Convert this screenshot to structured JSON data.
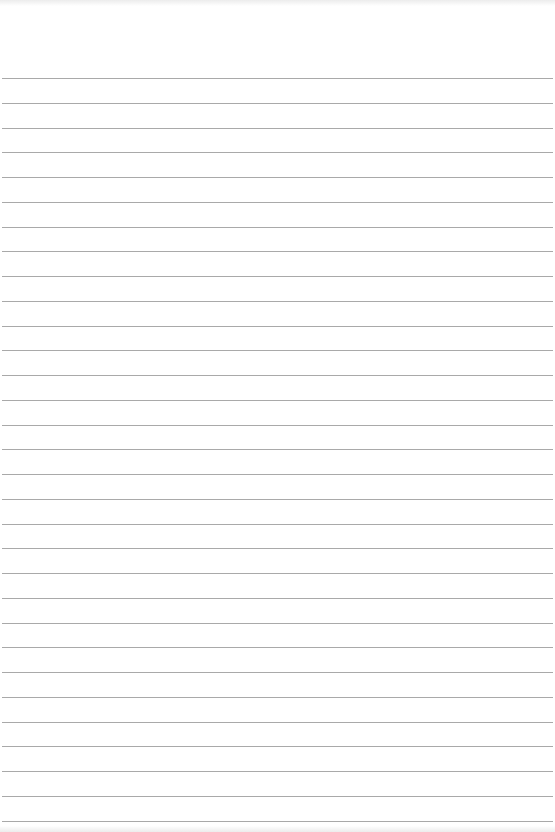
{
  "page": {
    "type": "lined-paper",
    "background_color": "#ffffff",
    "line_color": "#a9a9a9",
    "first_line_y": 78,
    "line_spacing": 24.75,
    "line_count": 31,
    "text": ""
  }
}
